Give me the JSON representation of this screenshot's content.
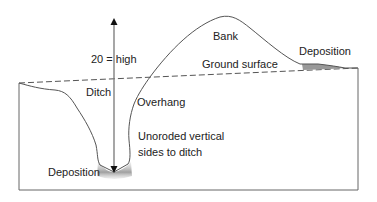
{
  "diagram": {
    "labels": {
      "height": "20 = high",
      "bank": "Bank",
      "deposition_right": "Deposition",
      "ground_surface": "Ground surface",
      "ditch": "Ditch",
      "overhang": "Overhang",
      "unoroded_line1": "Unoroded vertical",
      "unoroded_line2": "sides to ditch",
      "deposition_bottom": "Deposition"
    },
    "colors": {
      "line": "#555555",
      "arrow": "#777777",
      "deposition_fill": "#999999",
      "frame": "#666666"
    }
  }
}
